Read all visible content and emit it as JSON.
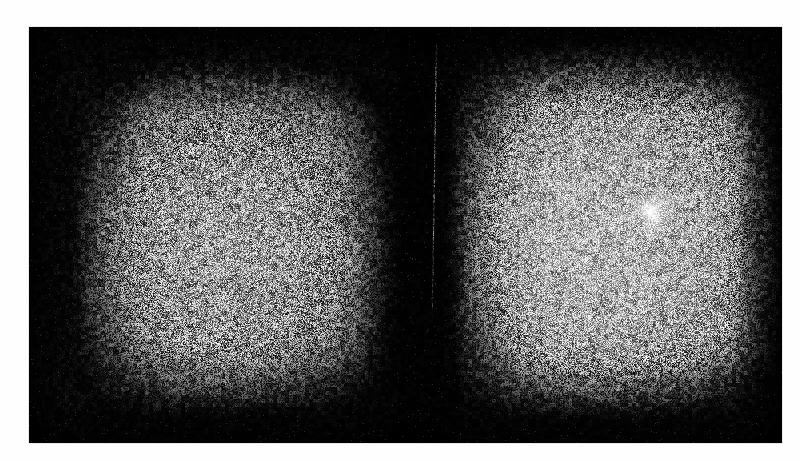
{
  "document": {
    "background_color": "#ffffff",
    "plate": {
      "label": "scanned-detector-plate",
      "background_color": "#050505",
      "left": 29,
      "top": 27,
      "width": 753,
      "height": 416
    }
  },
  "chart_data": {
    "type": "heatmap",
    "title": "",
    "subtitle": "",
    "xlabel": "",
    "ylabel": "",
    "colormap": "grayscale",
    "grid": false,
    "legend": "none",
    "regions": [
      {
        "name": "left-illuminated-field",
        "shape": "rounded-square",
        "center_x": 205,
        "center_y": 207,
        "width": 300,
        "height": 340,
        "peak_gray": 168,
        "edge_gray": 12,
        "falloff": "soft-noisy"
      },
      {
        "name": "right-illuminated-field",
        "shape": "rounded-square",
        "center_x": 590,
        "center_y": 203,
        "width": 318,
        "height": 352,
        "peak_gray": 190,
        "edge_gray": 14,
        "falloff": "soft-noisy"
      },
      {
        "name": "inter-field-gutter",
        "shape": "vertical-band",
        "center_x": 390,
        "width": 104,
        "peak_gray": 8
      }
    ],
    "features": [
      {
        "name": "bright-point-source",
        "x": 651,
        "y": 213,
        "peak_gray": 255,
        "core_width": 30,
        "core_height": 36,
        "halo_radius": 40,
        "orientation_deg": -18
      },
      {
        "name": "source-streak",
        "x_start": 659,
        "y_start": 202,
        "x_end": 710,
        "y_end": 192,
        "gray": 250,
        "angle_deg": -11
      },
      {
        "name": "vertical-scratch",
        "x_top": 436,
        "y_top": 43,
        "x_bottom": 441,
        "y_bottom": 325,
        "gray": 150
      }
    ],
    "gray_range": [
      0,
      255
    ],
    "grain": {
      "type": "film-speckle",
      "amplitude": "high",
      "scale_px": 2
    }
  }
}
